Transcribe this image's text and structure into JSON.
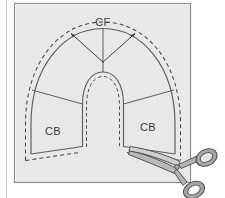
{
  "figure": {
    "kind": "sewing-pattern-diagram",
    "background_color": "#ffffff",
    "fabric": {
      "label": "fabric-square",
      "fill": "#e6e6e6",
      "border_color": "#808080",
      "left_rule_color": "#cccccc"
    },
    "pattern_piece": {
      "outline_color": "#5a5a5a",
      "cutting_line_color": "#4a4a4a",
      "cutting_line_style": "dashed",
      "inner_opening": "neckline-horseshoe"
    },
    "labels": [
      {
        "id": "center-front",
        "text": "CF",
        "x": 103,
        "y": 26
      },
      {
        "id": "center-back-left",
        "text": "CB",
        "x": 53,
        "y": 135
      },
      {
        "id": "center-back-right",
        "text": "CB",
        "x": 148,
        "y": 131
      }
    ],
    "arrows": {
      "count": 2,
      "origin_label": "pivot-point",
      "color": "#4a4a4a",
      "note": "two grain / stretch direction arrows radiating up-left and up-right from the pivot"
    },
    "scissors": {
      "label": "scissors",
      "body_color": "#9a9a9a",
      "outline_color": "#4a4a4a",
      "handle_fill": "#d8d8d8",
      "position": "bottom-right",
      "action": "cutting along the dashed cutting line at the right CB edge"
    }
  }
}
